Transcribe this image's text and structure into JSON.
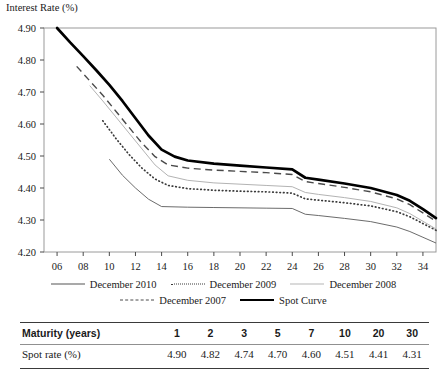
{
  "chart_data": {
    "type": "line",
    "title": "",
    "ylabel": "Interest Rate (%)",
    "xlabel": "",
    "ylim": [
      4.2,
      4.9
    ],
    "xlim": [
      5,
      35
    ],
    "ytick_labels": [
      "4.20",
      "4.30",
      "4.40",
      "4.50",
      "4.60",
      "4.70",
      "4.80",
      "4.90"
    ],
    "ytick_values": [
      4.2,
      4.3,
      4.4,
      4.5,
      4.6,
      4.7,
      4.8,
      4.9
    ],
    "xtick_labels": [
      "06",
      "08",
      "10",
      "12",
      "14",
      "16",
      "18",
      "20",
      "22",
      "24",
      "26",
      "28",
      "30",
      "32",
      "34"
    ],
    "xtick_values": [
      6,
      8,
      10,
      12,
      14,
      16,
      18,
      20,
      22,
      24,
      26,
      28,
      30,
      32,
      34
    ],
    "grid": false,
    "legend_position": "below",
    "series": [
      {
        "name": "December 2010",
        "style": "solid-thin",
        "color": "#5a5a5a",
        "points": [
          [
            10,
            4.49
          ],
          [
            11,
            4.44
          ],
          [
            12,
            4.4
          ],
          [
            13,
            4.365
          ],
          [
            14,
            4.342
          ],
          [
            16,
            4.34
          ],
          [
            18,
            4.339
          ],
          [
            20,
            4.338
          ],
          [
            22,
            4.337
          ],
          [
            24,
            4.336
          ],
          [
            25,
            4.318
          ],
          [
            26,
            4.314
          ],
          [
            28,
            4.305
          ],
          [
            30,
            4.295
          ],
          [
            32,
            4.278
          ],
          [
            33,
            4.264
          ],
          [
            34,
            4.246
          ],
          [
            35,
            4.228
          ]
        ]
      },
      {
        "name": "December 2009",
        "style": "dotted",
        "color": "#3a3a3a",
        "points": [
          [
            9.5,
            4.61
          ],
          [
            10.5,
            4.555
          ],
          [
            11.5,
            4.505
          ],
          [
            12.5,
            4.462
          ],
          [
            13.5,
            4.428
          ],
          [
            14.5,
            4.408
          ],
          [
            16,
            4.398
          ],
          [
            18,
            4.393
          ],
          [
            20,
            4.39
          ],
          [
            22,
            4.388
          ],
          [
            24,
            4.384
          ],
          [
            25,
            4.366
          ],
          [
            26,
            4.362
          ],
          [
            28,
            4.354
          ],
          [
            30,
            4.344
          ],
          [
            32,
            4.326
          ],
          [
            33,
            4.31
          ],
          [
            34,
            4.289
          ],
          [
            35,
            4.268
          ]
        ]
      },
      {
        "name": "December 2008",
        "style": "solid-light",
        "color": "#b3b3b3",
        "points": [
          [
            8.5,
            4.72
          ],
          [
            9.5,
            4.672
          ],
          [
            10.5,
            4.622
          ],
          [
            11.5,
            4.572
          ],
          [
            12.5,
            4.522
          ],
          [
            13.5,
            4.472
          ],
          [
            14.5,
            4.438
          ],
          [
            16,
            4.424
          ],
          [
            18,
            4.416
          ],
          [
            20,
            4.412
          ],
          [
            22,
            4.408
          ],
          [
            24,
            4.404
          ],
          [
            25,
            4.386
          ],
          [
            26,
            4.38
          ],
          [
            28,
            4.37
          ],
          [
            30,
            4.358
          ],
          [
            32,
            4.338
          ],
          [
            33,
            4.32
          ],
          [
            34,
            4.296
          ],
          [
            35,
            4.272
          ]
        ]
      },
      {
        "name": "December 2007",
        "style": "dashed",
        "color": "#4a4a4a",
        "points": [
          [
            7.5,
            4.78
          ],
          [
            8.5,
            4.735
          ],
          [
            9.5,
            4.69
          ],
          [
            10.5,
            4.64
          ],
          [
            11.5,
            4.59
          ],
          [
            12.5,
            4.54
          ],
          [
            13.5,
            4.498
          ],
          [
            14.5,
            4.472
          ],
          [
            16,
            4.462
          ],
          [
            18,
            4.456
          ],
          [
            20,
            4.452
          ],
          [
            22,
            4.448
          ],
          [
            24,
            4.442
          ],
          [
            25,
            4.42
          ],
          [
            26,
            4.414
          ],
          [
            28,
            4.402
          ],
          [
            30,
            4.388
          ],
          [
            32,
            4.366
          ],
          [
            33,
            4.348
          ],
          [
            34,
            4.322
          ],
          [
            35,
            4.296
          ]
        ]
      },
      {
        "name": "Spot Curve",
        "style": "solid-thick",
        "color": "#000000",
        "points": [
          [
            6,
            4.9
          ],
          [
            7,
            4.855
          ],
          [
            8,
            4.812
          ],
          [
            9,
            4.768
          ],
          [
            10,
            4.722
          ],
          [
            11,
            4.672
          ],
          [
            12,
            4.618
          ],
          [
            13,
            4.564
          ],
          [
            14,
            4.52
          ],
          [
            15,
            4.498
          ],
          [
            16,
            4.486
          ],
          [
            18,
            4.476
          ],
          [
            20,
            4.47
          ],
          [
            22,
            4.464
          ],
          [
            24,
            4.458
          ],
          [
            25,
            4.432
          ],
          [
            26,
            4.426
          ],
          [
            28,
            4.414
          ],
          [
            30,
            4.4
          ],
          [
            32,
            4.378
          ],
          [
            33,
            4.36
          ],
          [
            34,
            4.334
          ],
          [
            35,
            4.306
          ]
        ]
      }
    ]
  },
  "legend": {
    "rows": [
      [
        {
          "label": "December 2010",
          "style": "solid-thin"
        },
        {
          "label": "December 2009",
          "style": "dotted"
        },
        {
          "label": "December 2008",
          "style": "solid-light"
        }
      ],
      [
        {
          "label": "December 2007",
          "style": "dashed"
        },
        {
          "label": "Spot Curve",
          "style": "solid-thick"
        }
      ]
    ]
  },
  "table": {
    "header_label": "Maturity (years)",
    "header_values": [
      "1",
      "2",
      "3",
      "5",
      "7",
      "10",
      "20",
      "30"
    ],
    "row_label": "Spot rate (%)",
    "row_values": [
      "4.90",
      "4.82",
      "4.74",
      "4.70",
      "4.60",
      "4.51",
      "4.41",
      "4.31"
    ]
  }
}
